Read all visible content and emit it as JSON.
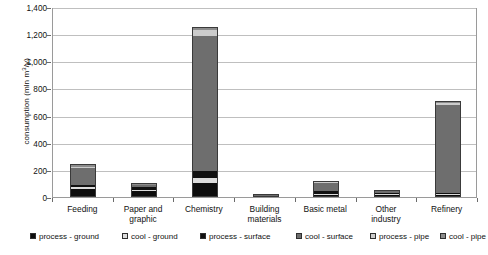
{
  "chart_data": {
    "type": "bar",
    "stacked": true,
    "title": "",
    "xlabel": "",
    "ylabel": "consumption (mln m3/y)",
    "ylabel_parts": {
      "pre": "consumption (mln m",
      "sup": "3",
      "post": "/y)"
    },
    "ylim": [
      0,
      1400
    ],
    "ytick_step": 200,
    "yticks": [
      0,
      200,
      400,
      600,
      800,
      1000,
      1200,
      1400
    ],
    "ytick_labels": [
      "0",
      "200",
      "400",
      "600",
      "800",
      "1,000",
      "1,200",
      "1,400"
    ],
    "grid": true,
    "grid_axis": "y",
    "legend_position": "bottom",
    "categories": [
      "Feeding",
      "Paper and graphic",
      "Chemistry",
      "Building materials",
      "Basic metal",
      "Other industry",
      "Refinery"
    ],
    "category_lines": [
      [
        "Feeding"
      ],
      [
        "Paper and",
        "graphic"
      ],
      [
        "Chemistry"
      ],
      [
        "Building",
        "materials"
      ],
      [
        "Basic metal"
      ],
      [
        "Other",
        "industry"
      ],
      [
        "Refinery"
      ]
    ],
    "series": [
      {
        "name": "process - ground",
        "color": "#0d0d0d",
        "values": [
          55,
          42,
          95,
          6,
          10,
          12,
          8
        ]
      },
      {
        "name": "cool - ground",
        "color": "#dcdcdc",
        "values": [
          12,
          8,
          40,
          2,
          6,
          5,
          6
        ]
      },
      {
        "name": "process - surface",
        "color": "#111111",
        "values": [
          18,
          30,
          55,
          3,
          30,
          10,
          10
        ]
      },
      {
        "name": "cool - surface",
        "color": "#6e6e6e",
        "values": [
          132,
          14,
          1000,
          7,
          62,
          22,
          660
        ]
      },
      {
        "name": "process - pipe",
        "color": "#cccccc",
        "values": [
          14,
          3,
          50,
          1,
          6,
          3,
          14
        ]
      },
      {
        "name": "cool - pipe",
        "color": "#8c8c8c",
        "values": [
          14,
          3,
          15,
          1,
          6,
          3,
          12
        ]
      }
    ],
    "totals": [
      245,
      100,
      1255,
      20,
      120,
      55,
      710
    ]
  }
}
